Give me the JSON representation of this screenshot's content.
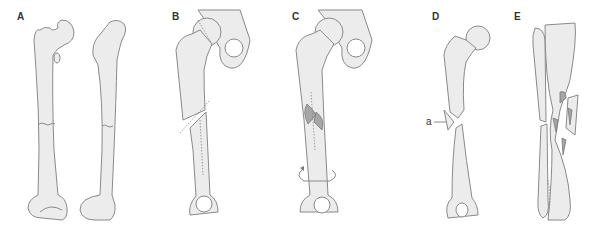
{
  "figure": {
    "panels": [
      {
        "id": "A",
        "label": "A",
        "depicts": "Transverse fracture of femoral shaft (anterior and lateral views)"
      },
      {
        "id": "B",
        "label": "B",
        "depicts": "Oblique fracture of femoral shaft"
      },
      {
        "id": "C",
        "label": "C",
        "depicts": "Spiral fracture of femoral shaft with rotation arrow"
      },
      {
        "id": "D",
        "label": "D",
        "depicts": "Butterfly fragment fracture of femur",
        "annotation": "a"
      },
      {
        "id": "E",
        "label": "E",
        "depicts": "Comminuted fracture of tibia and fibula"
      }
    ],
    "colors": {
      "bone_fill": "#ececec",
      "outline": "#8a8a8a",
      "fragment_shade": "#a6a6a6"
    }
  }
}
